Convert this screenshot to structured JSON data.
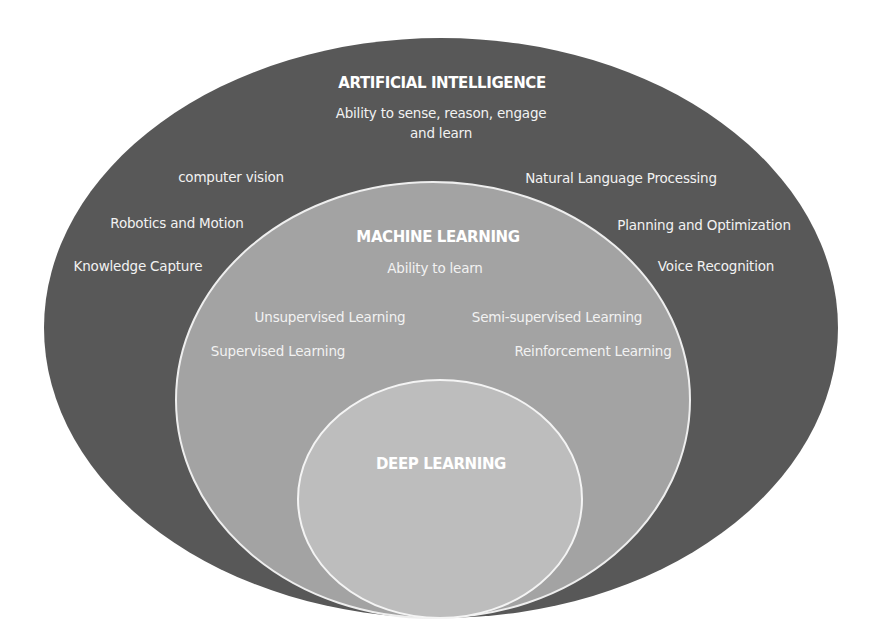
{
  "diagram": {
    "type": "nested-ellipse",
    "colors": {
      "background": "#ffffff",
      "artificial_intelligence": "#585858",
      "machine_learning": "#a3a3a3",
      "deep_learning": "#bdbdbd",
      "outline": "#eeeeee",
      "text": "#f2f2f2"
    },
    "artificial_intelligence": {
      "title": "ARTIFICIAL INTELLIGENCE",
      "description": "Ability to sense, reason, engage and learn",
      "description_line1": "Ability to sense, reason, engage",
      "description_line2": "and learn",
      "items": [
        "computer vision",
        "Natural Language Processing",
        "Robotics and Motion",
        "Planning and Optimization",
        "Knowledge Capture",
        "Voice Recognition"
      ]
    },
    "machine_learning": {
      "title": "MACHINE LEARNING",
      "description": "Ability to learn",
      "items": [
        "Unsupervised Learning",
        "Semi-supervised Learning",
        "Supervised Learning",
        "Reinforcement Learning"
      ]
    },
    "deep_learning": {
      "title": "DEEP LEARNING"
    }
  }
}
